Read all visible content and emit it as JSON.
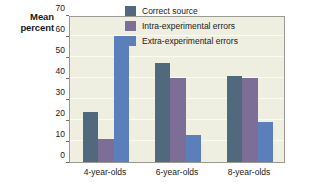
{
  "chart_data": {
    "type": "bar",
    "title": "",
    "xlabel": "",
    "ylabel": "Mean percent",
    "ylabel_lines": [
      "Mean",
      "percent"
    ],
    "categories": [
      "4-year-olds",
      "6-year-olds",
      "8-year-olds"
    ],
    "series": [
      {
        "name": "Correct source",
        "color": "#50697d",
        "values": [
          24,
          47,
          41
        ]
      },
      {
        "name": "Intra-experimental errors",
        "color": "#7c6e96",
        "values": [
          11,
          40,
          40
        ]
      },
      {
        "name": "Extra-experimental errors",
        "color": "#5b7fba",
        "values": [
          60,
          13,
          19
        ]
      }
    ],
    "ylim": [
      0,
      70
    ],
    "yticks": [
      0,
      10,
      20,
      30,
      40,
      50,
      60,
      70
    ],
    "ytick_labels": [
      "0",
      "10",
      "20",
      "30",
      "40",
      "50",
      "60",
      "70"
    ],
    "grid": true,
    "grid_color": "#fbfbf2",
    "legend_position": "top-right",
    "plot_background": "#eeeee1",
    "page_background": "#ffffff",
    "axis_color": "#9a9a92"
  }
}
